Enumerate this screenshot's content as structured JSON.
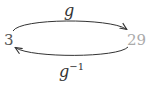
{
  "diagram": {
    "nodes": {
      "left": {
        "label": "3",
        "color": "#555555"
      },
      "right": {
        "label": "29",
        "color": "#aaaaaa"
      }
    },
    "edges": {
      "forward": {
        "label_base": "g",
        "from": "3",
        "to": "29"
      },
      "inverse": {
        "label_base": "g",
        "label_sup": "−1",
        "from": "29",
        "to": "3"
      }
    },
    "arrow_color": "#333333"
  }
}
